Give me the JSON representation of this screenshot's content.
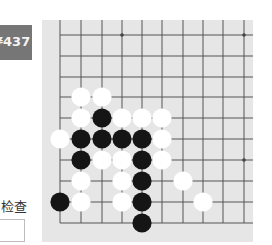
{
  "badge": {
    "text": "¥437",
    "color": "#767676"
  },
  "check": {
    "label": "检查",
    "input_value": "",
    "input_placeholder": ""
  },
  "board": {
    "background": "#e6e6e6",
    "line_color": "#555555",
    "columns_x": [
      60,
      81,
      102,
      122,
      142,
      162,
      183,
      203,
      223,
      244
    ],
    "rows_y": [
      35,
      56,
      77,
      97,
      118,
      139,
      160,
      181,
      202,
      223
    ],
    "star_points": [
      [
        3,
        0
      ],
      [
        9,
        0
      ],
      [
        9,
        6
      ]
    ],
    "stones": [
      {
        "color": "white",
        "col": 1,
        "row": 3
      },
      {
        "color": "white",
        "col": 2,
        "row": 3
      },
      {
        "color": "white",
        "col": 1,
        "row": 4
      },
      {
        "color": "black",
        "col": 2,
        "row": 4
      },
      {
        "color": "white",
        "col": 3,
        "row": 4
      },
      {
        "color": "white",
        "col": 4,
        "row": 4
      },
      {
        "color": "white",
        "col": 5,
        "row": 4
      },
      {
        "color": "white",
        "col": 0,
        "row": 5
      },
      {
        "color": "black",
        "col": 1,
        "row": 5
      },
      {
        "color": "black",
        "col": 2,
        "row": 5
      },
      {
        "color": "black",
        "col": 3,
        "row": 5
      },
      {
        "color": "black",
        "col": 4,
        "row": 5
      },
      {
        "color": "white",
        "col": 5,
        "row": 5
      },
      {
        "color": "black",
        "col": 1,
        "row": 6
      },
      {
        "color": "white",
        "col": 2,
        "row": 6
      },
      {
        "color": "white",
        "col": 3,
        "row": 6
      },
      {
        "color": "black",
        "col": 4,
        "row": 6
      },
      {
        "color": "white",
        "col": 5,
        "row": 6
      },
      {
        "color": "white",
        "col": 1,
        "row": 7
      },
      {
        "color": "white",
        "col": 3,
        "row": 7
      },
      {
        "color": "black",
        "col": 4,
        "row": 7
      },
      {
        "color": "white",
        "col": 6,
        "row": 7
      },
      {
        "color": "black",
        "col": 0,
        "row": 8
      },
      {
        "color": "white",
        "col": 1,
        "row": 8
      },
      {
        "color": "white",
        "col": 3,
        "row": 8
      },
      {
        "color": "black",
        "col": 4,
        "row": 8
      },
      {
        "color": "white",
        "col": 7,
        "row": 8
      },
      {
        "color": "black",
        "col": 4,
        "row": 9
      }
    ]
  }
}
